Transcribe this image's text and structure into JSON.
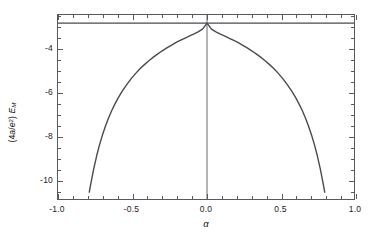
{
  "figure": {
    "background_color": "#ffffff",
    "frame_color": "#555a60",
    "curve_color": "#4a4a52"
  },
  "axes": {
    "x": {
      "title": "α",
      "min": -1.0,
      "max": 1.0,
      "major_ticks": [
        -1.0,
        -0.5,
        0.0,
        0.5,
        1.0
      ],
      "major_tick_labels": [
        "-1.0",
        "-0.5",
        "0.0",
        "0.5",
        "1.0"
      ],
      "minor_tick_step": 0.1
    },
    "y": {
      "title_prefix": "(4",
      "title_a": "a",
      "title_slash": "/",
      "title_e": "e",
      "title_sup": "2",
      "title_close": ") ",
      "title_E": "E",
      "title_sub": "M",
      "title_plain": "(4a/e2) EM",
      "min": -10.92,
      "max": -2.45,
      "major_ticks": [
        -4,
        -6,
        -8,
        -10
      ],
      "major_tick_labels": [
        "-4",
        "-6",
        "-8",
        "-10"
      ],
      "minor_tick_step": 0.5
    }
  },
  "chart_data": {
    "type": "line",
    "title": "",
    "xlabel": "α",
    "ylabel": "(4a/e²) E_M",
    "xlim": [
      -1.0,
      1.0
    ],
    "ylim": [
      -10.92,
      -2.45
    ],
    "grid": false,
    "legend": false,
    "series": [
      {
        "name": "reference-level",
        "kind": "horizontal-line",
        "y": -2.82,
        "x_start": -1.0,
        "x_end": 1.0,
        "color": "#4a4a52"
      },
      {
        "name": "zero-axis",
        "kind": "vertical-line",
        "x": 0.0,
        "color": "#6a6a72"
      },
      {
        "name": "madelung-energy",
        "kind": "curve",
        "color": "#4a4a52",
        "x": [
          -0.79,
          -0.78,
          -0.76,
          -0.74,
          -0.72,
          -0.7,
          -0.68,
          -0.66,
          -0.64,
          -0.62,
          -0.6,
          -0.57,
          -0.54,
          -0.51,
          -0.48,
          -0.45,
          -0.42,
          -0.39,
          -0.36,
          -0.33,
          -0.3,
          -0.27,
          -0.24,
          -0.21,
          -0.18,
          -0.15,
          -0.12,
          -0.09,
          -0.06,
          -0.03,
          0.0,
          0.03,
          0.06,
          0.09,
          0.12,
          0.15,
          0.18,
          0.21,
          0.24,
          0.27,
          0.3,
          0.33,
          0.36,
          0.39,
          0.42,
          0.45,
          0.48,
          0.51,
          0.54,
          0.57,
          0.6,
          0.62,
          0.64,
          0.66,
          0.68,
          0.7,
          0.72,
          0.74,
          0.76,
          0.78,
          0.79
        ],
        "y": [
          -10.52,
          -10.14,
          -9.45,
          -8.85,
          -8.33,
          -7.88,
          -7.48,
          -7.13,
          -6.81,
          -6.53,
          -6.27,
          -5.93,
          -5.63,
          -5.36,
          -5.12,
          -4.9,
          -4.71,
          -4.53,
          -4.37,
          -4.22,
          -4.08,
          -3.95,
          -3.83,
          -3.71,
          -3.61,
          -3.51,
          -3.41,
          -3.32,
          -3.22,
          -3.09,
          -2.82,
          -3.09,
          -3.22,
          -3.32,
          -3.41,
          -3.51,
          -3.61,
          -3.71,
          -3.83,
          -3.95,
          -4.08,
          -4.22,
          -4.37,
          -4.53,
          -4.71,
          -4.9,
          -5.12,
          -5.36,
          -5.63,
          -5.93,
          -6.27,
          -6.53,
          -6.81,
          -7.13,
          -7.48,
          -7.88,
          -8.33,
          -8.85,
          -9.45,
          -10.14,
          -10.52
        ]
      }
    ]
  }
}
